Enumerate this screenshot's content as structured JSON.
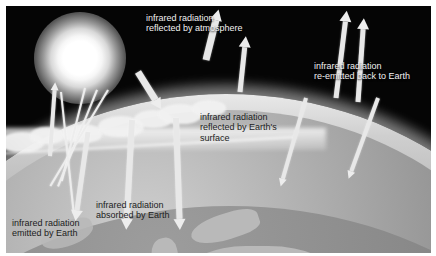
{
  "diagram": {
    "colors": {
      "space": "#050505",
      "frame": "#ffffff",
      "sun": "#ffffff",
      "atmosphere": "#cfcfcf",
      "earth_surface": "#8d8d8d",
      "land": "#b9b9b9",
      "cloud": "#f2f2f2",
      "arrow": "#ededed",
      "text_on_dark": "#f2f2f2",
      "text_on_light": "#1c1c1c"
    },
    "labels": [
      {
        "id": "reflected-by-atmosphere",
        "text": "infrared radiation\nreflected by atmosphere",
        "tone": "on-dark",
        "x": 146,
        "y": 13
      },
      {
        "id": "re-emitted-back-to-earth",
        "text": "infrared radiation\nre-emitted back to Earth",
        "tone": "on-dark",
        "x": 314,
        "y": 61
      },
      {
        "id": "reflected-by-earths-surface",
        "text": "infrared radiation\nreflected by Earth's\nsurface",
        "tone": "on-light",
        "x": 200,
        "y": 112
      },
      {
        "id": "absorbed-by-earth",
        "text": "infrared radiation\nabsorbed by Earth",
        "tone": "on-light",
        "x": 96,
        "y": 200
      },
      {
        "id": "emitted-by-earth",
        "text": "infrared radiation\nemitted by Earth",
        "tone": "on-light",
        "x": 12,
        "y": 218
      }
    ],
    "elements": {
      "sun_name": "sun",
      "earth_name": "earth-globe",
      "atmosphere_name": "atmosphere-layer",
      "clouds_name": "cloud-band",
      "space_name": "space-background"
    },
    "sun_rays": [
      {
        "x": 84,
        "y": 82,
        "len": 96,
        "rot": 14,
        "w": 2.4
      },
      {
        "x": 96,
        "y": 84,
        "len": 104,
        "rot": 22,
        "w": 2.4
      },
      {
        "x": 107,
        "y": 84,
        "len": 112,
        "rot": 31,
        "w": 2.4
      },
      {
        "x": 60,
        "y": 86,
        "len": 122,
        "rot": -6,
        "w": 2.2
      }
    ],
    "arrows": [
      {
        "id": "incoming-to-atmosphere",
        "x": 132,
        "y": 66,
        "len": 44,
        "rot": 148,
        "w": 7
      },
      {
        "id": "reflected-up-atmosphere",
        "x": 200,
        "y": 54,
        "len": 52,
        "rot": 14,
        "w": 7
      },
      {
        "id": "reflected-earth-surface",
        "x": 234,
        "y": 86,
        "len": 56,
        "rot": 6,
        "w": 5
      },
      {
        "id": "absorbed-down-left",
        "x": 82,
        "y": 126,
        "len": 90,
        "rot": 188,
        "w": 5
      },
      {
        "id": "absorbed-down-mid",
        "x": 126,
        "y": 114,
        "len": 110,
        "rot": 183,
        "w": 6
      },
      {
        "id": "absorbed-down-right",
        "x": 170,
        "y": 112,
        "len": 112,
        "rot": 178,
        "w": 6
      },
      {
        "id": "emitted-up-left",
        "x": 44,
        "y": 150,
        "len": 74,
        "rot": 4,
        "w": 4
      },
      {
        "id": "reemit-up-a",
        "x": 330,
        "y": 92,
        "len": 88,
        "rot": 7,
        "w": 5
      },
      {
        "id": "reemit-up-b",
        "x": 352,
        "y": 96,
        "len": 84,
        "rot": 4,
        "w": 5
      },
      {
        "id": "reemit-down-a",
        "x": 300,
        "y": 92,
        "len": 92,
        "rot": 196,
        "w": 4
      },
      {
        "id": "reemit-down-b",
        "x": 372,
        "y": 92,
        "len": 86,
        "rot": 200,
        "w": 4
      }
    ]
  }
}
